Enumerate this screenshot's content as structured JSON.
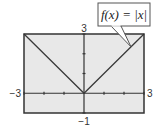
{
  "chart_data": {
    "type": "line",
    "title": "",
    "annotation": "f(x) = |x|",
    "xlabel": "",
    "ylabel": "",
    "xlim": [
      -3,
      3
    ],
    "ylim": [
      -1,
      3
    ],
    "x_tick_values": [
      -3,
      -2,
      -1,
      0,
      1,
      2,
      3
    ],
    "y_tick_values": [
      -1,
      0,
      1,
      2,
      3
    ],
    "window_labels": {
      "xmin": "−3",
      "xmax": "3",
      "ymin": "−1",
      "ymax": "3"
    },
    "grid": false,
    "legend": "none",
    "series": [
      {
        "name": "f(x) = |x|",
        "x": [
          -3,
          -2,
          -1,
          0,
          1,
          2,
          3
        ],
        "y": [
          3,
          2,
          1,
          0,
          1,
          2,
          3
        ]
      }
    ],
    "colors": {
      "plot_background": "#e8e8e8",
      "frame": "#333333",
      "line": "#3a3a3a",
      "callout_border": "#555555"
    }
  }
}
